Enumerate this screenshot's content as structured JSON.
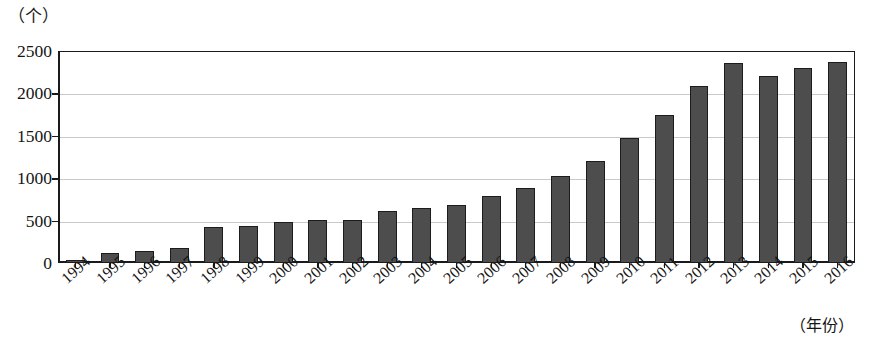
{
  "chart_data": {
    "type": "bar",
    "title": "",
    "xlabel": "（年份）",
    "ylabel": "（个）",
    "ylim": [
      0,
      2500
    ],
    "yticks": [
      0,
      500,
      1000,
      1500,
      2000,
      2500
    ],
    "ytick_labels": [
      "0",
      "500",
      "1000",
      "1500",
      "2000",
      "2500"
    ],
    "grid": true,
    "legend": "none",
    "categories": [
      "1994",
      "1995",
      "1996",
      "1997",
      "1998",
      "1999",
      "2000",
      "2001",
      "2002",
      "2003",
      "2004",
      "2005",
      "2006",
      "2007",
      "2008",
      "2009",
      "2010",
      "2011",
      "2012",
      "2013",
      "2014",
      "2015",
      "2016"
    ],
    "values": [
      35,
      118,
      145,
      175,
      425,
      440,
      480,
      510,
      505,
      615,
      645,
      690,
      785,
      890,
      1030,
      1200,
      1480,
      1750,
      2090,
      2360,
      2200,
      2305,
      2375
    ],
    "series": [
      {
        "name": "数量",
        "values": [
          35,
          118,
          145,
          175,
          425,
          440,
          480,
          510,
          505,
          615,
          645,
          690,
          785,
          890,
          1030,
          1200,
          1480,
          1750,
          2090,
          2360,
          2200,
          2305,
          2375
        ]
      }
    ],
    "bar_color": "#4d4d4d",
    "bar_edge_color": "#1c1c1c",
    "grid_color": "#c9c9c9",
    "axis_color": "#1a1a1a",
    "background": "#ffffff"
  }
}
